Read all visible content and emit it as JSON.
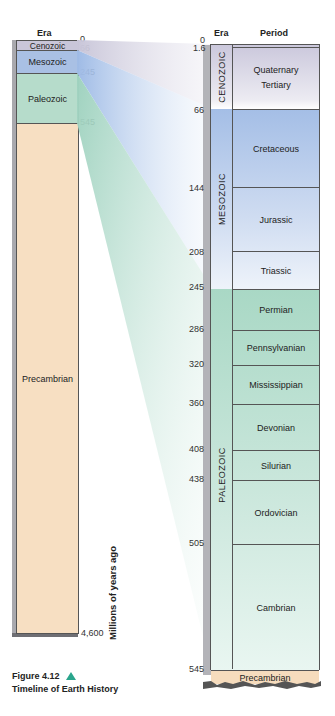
{
  "figure": {
    "caption_number": "Figure 4.12",
    "caption_title": "Timeline of Earth History",
    "axis_label": "Millions of years ago"
  },
  "left_column": {
    "header": "Era",
    "eras": [
      {
        "name": "Cenozoic",
        "start": 0,
        "end": 66,
        "color": "#c9c6d9"
      },
      {
        "name": "Mesozoic",
        "start": 66,
        "end": 245,
        "color": "#a9c0e4"
      },
      {
        "name": "Paleozoic",
        "start": 245,
        "end": 545,
        "color": "#b6dccb"
      },
      {
        "name": "Precambrian",
        "start": 545,
        "end": 4600,
        "color": "#f7dfc2"
      }
    ],
    "ticks": [
      "0",
      "66",
      "245",
      "545",
      "4,600"
    ]
  },
  "right_column": {
    "era_header": "Era",
    "period_header": "Period",
    "eras": [
      {
        "name": "CENOZOIC",
        "start": 0,
        "end": 66
      },
      {
        "name": "MESOZOIC",
        "start": 66,
        "end": 245
      },
      {
        "name": "PALEOZOIC",
        "start": 245,
        "end": 545
      }
    ],
    "periods": [
      {
        "name": "Quaternary",
        "start": 0,
        "end": 1.6
      },
      {
        "name": "Tertiary",
        "start": 1.6,
        "end": 66
      },
      {
        "name": "Cretaceous",
        "start": 66,
        "end": 144
      },
      {
        "name": "Jurassic",
        "start": 144,
        "end": 208
      },
      {
        "name": "Triassic",
        "start": 208,
        "end": 245
      },
      {
        "name": "Permian",
        "start": 245,
        "end": 286
      },
      {
        "name": "Pennsylvanian",
        "start": 286,
        "end": 320
      },
      {
        "name": "Mississippian",
        "start": 320,
        "end": 360
      },
      {
        "name": "Devonian",
        "start": 360,
        "end": 408
      },
      {
        "name": "Silurian",
        "start": 408,
        "end": 438
      },
      {
        "name": "Ordovician",
        "start": 438,
        "end": 505
      },
      {
        "name": "Cambrian",
        "start": 505,
        "end": 545
      },
      {
        "name": "Precambrian",
        "start": 545,
        "end": null
      }
    ],
    "ticks": [
      "0",
      "1.6",
      "66",
      "144",
      "208",
      "245",
      "286",
      "320",
      "360",
      "408",
      "438",
      "505",
      "545"
    ]
  },
  "colors": {
    "cenozoic": "#cfcbe0",
    "mesozoic": "#a6bfe6",
    "paleozoic": "#a9d9c6",
    "precambrian": "#f6dcbd",
    "accent_triangle": "#2aa58c"
  }
}
